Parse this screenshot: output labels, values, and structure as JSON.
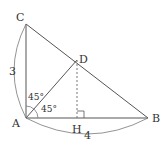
{
  "diagram": {
    "points": {
      "A": {
        "label": "A",
        "x": 26,
        "y": 118
      },
      "B": {
        "label": "B",
        "x": 148,
        "y": 118
      },
      "C": {
        "label": "C",
        "x": 26,
        "y": 24
      },
      "D": {
        "label": "D",
        "x": 77,
        "y": 60
      },
      "H": {
        "label": "H",
        "x": 77,
        "y": 118
      }
    },
    "lengths": {
      "AC": "3",
      "AB": "4"
    },
    "angles": {
      "CAD": "45°",
      "DAB": "45°"
    },
    "colors": {
      "line": "#555555",
      "text": "#333333"
    }
  }
}
